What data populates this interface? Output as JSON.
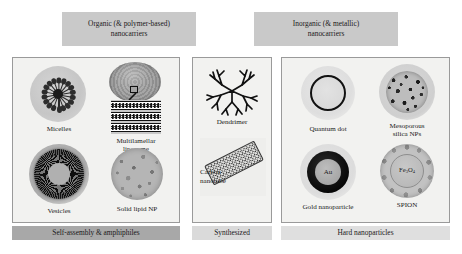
{
  "figure": {
    "headers": [
      {
        "id": "organic",
        "line1": "Organic (& polymer-based)",
        "line2": "nanocarriers"
      },
      {
        "id": "inorganic",
        "line1": "Inorganic (& metallic)",
        "line2": "nanocarriers"
      }
    ],
    "footers": [
      {
        "id": "self-assembly",
        "label": "Self-assembly & amphiphiles",
        "color": "#a8a8a8"
      },
      {
        "id": "synthesized",
        "label": "Synthesized",
        "color": "#dadada"
      },
      {
        "id": "hard",
        "label": "Hard nanoparticles",
        "color": "#dfdfdf"
      }
    ],
    "panels": [
      {
        "id": "organic-panel",
        "items": [
          {
            "id": "micelles",
            "label": "Micelles"
          },
          {
            "id": "liposome",
            "label_line1": "Multilamellar",
            "label_line2": "liposome"
          },
          {
            "id": "vesicles",
            "label": "Vesicles"
          },
          {
            "id": "solid-lipid",
            "label": "Solid lipid NP"
          }
        ]
      },
      {
        "id": "synthesized-panel",
        "items": [
          {
            "id": "dendrimer",
            "label": "Dendrimer"
          },
          {
            "id": "carbon-nanotube",
            "label_line1": "Carbon",
            "label_line2": "nanotube"
          }
        ]
      },
      {
        "id": "inorganic-panel",
        "items": [
          {
            "id": "quantum-dot",
            "label": "Quantum dot"
          },
          {
            "id": "mesoporous-silica",
            "label_line1": "Mesoporous",
            "label_line2": "silica NPs"
          },
          {
            "id": "gold-nanoparticle",
            "label": "Gold nanoparticle",
            "core_symbol": "Au"
          },
          {
            "id": "spion",
            "label": "SPION",
            "core_symbol_base1": "Fe",
            "core_symbol_sub1": "3",
            "core_symbol_base2": "O",
            "core_symbol_sub2": "4"
          }
        ]
      }
    ]
  }
}
